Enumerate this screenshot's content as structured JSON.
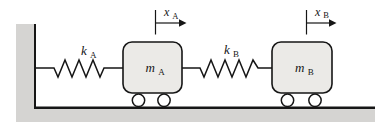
{
  "labels": {
    "spring_a": {
      "main": "k",
      "sub": "A"
    },
    "spring_b": {
      "main": "k",
      "sub": "B"
    },
    "mass_a": {
      "main": "m",
      "sub": "A"
    },
    "mass_b": {
      "main": "m",
      "sub": "B"
    },
    "axis_a": {
      "main": "x",
      "sub": "A"
    },
    "axis_b": {
      "main": "x",
      "sub": "B"
    }
  },
  "colors": {
    "ground": "#d5d4d2",
    "mass_fill": "#ebeae7",
    "wheel_fill": "#ffffff",
    "line": "#161616"
  }
}
